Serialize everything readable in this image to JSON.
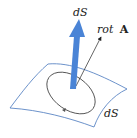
{
  "diagram": {
    "labels": {
      "normal_vector": "dS",
      "curl_vector_prefix": "rot",
      "curl_vector_symbol": "A",
      "surface_element": "dS"
    },
    "colors": {
      "surface_outline": "#5b86c4",
      "normal_arrow": "#4a84d6",
      "loop": "#555555",
      "curl_arrow": "#222222",
      "text": "#222222"
    }
  }
}
